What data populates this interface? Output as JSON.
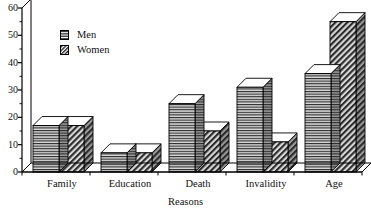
{
  "chart_data": {
    "type": "bar",
    "title": "",
    "subtitle": "",
    "xlabel": "Reasons",
    "ylabel": "",
    "ylim": [
      0,
      60
    ],
    "ytick_values": [
      0,
      10,
      20,
      30,
      40,
      50,
      60
    ],
    "ytick_labels": [
      "0",
      "10",
      "20",
      "30",
      "40",
      "50",
      "60"
    ],
    "minor_tick_step": 5,
    "grid": false,
    "legend_position": "upper-left-inside",
    "style": "3d-grouped-bars",
    "categories": [
      "Family",
      "Education",
      "Death",
      "Invalidity",
      "Age"
    ],
    "series": [
      {
        "name": "Men",
        "pattern": "horizontal-lines",
        "values": [
          17,
          7,
          25,
          31,
          36
        ]
      },
      {
        "name": "Women",
        "pattern": "diagonal-hatch",
        "values": [
          17,
          7,
          15,
          11,
          55
        ]
      }
    ]
  },
  "legend": {
    "items": [
      {
        "label": "Men",
        "swatch": "horizontal-lines-swatch"
      },
      {
        "label": "Women",
        "swatch": "diagonal-hatch-swatch"
      }
    ]
  },
  "colors": {
    "background": "#ffffff",
    "axis": "#000000",
    "bar_front": "#d9d9d9",
    "bar_side": "#8a8a8a",
    "bar_top": "#ffffff",
    "text": "#111111"
  }
}
